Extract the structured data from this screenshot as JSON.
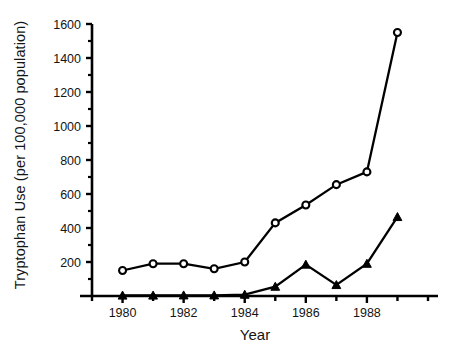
{
  "chart_data": {
    "type": "line",
    "title": "",
    "xlabel": "Year",
    "ylabel": "Tryptophan Use (per 100,000 population)",
    "x": [
      1980,
      1981,
      1982,
      1983,
      1984,
      1985,
      1986,
      1987,
      1988,
      1989
    ],
    "xlim": [
      1979,
      1990
    ],
    "ylim": [
      0,
      1600
    ],
    "y_major_ticks": [
      200,
      400,
      600,
      800,
      1000,
      1200,
      1400,
      1600
    ],
    "y_tick_labels": [
      "200",
      "400",
      "600",
      "800",
      "1000",
      "1200",
      "1400",
      "1600"
    ],
    "y_minor_ticks": [
      100,
      300,
      500,
      700,
      900,
      1100,
      1300,
      1500
    ],
    "x_major_ticks": [
      1980,
      1982,
      1984,
      1986,
      1988
    ],
    "x_tick_labels": [
      "1980",
      "1982",
      "1984",
      "1986",
      "1988"
    ],
    "x_all_ticks": [
      1979,
      1980,
      1981,
      1982,
      1983,
      1984,
      1985,
      1986,
      1987,
      1988,
      1989,
      1990
    ],
    "grid": false,
    "legend": "none",
    "series": [
      {
        "name": "open-circle-series",
        "marker": "open-circle",
        "color": "#000000",
        "values": [
          150,
          190,
          190,
          160,
          200,
          430,
          535,
          655,
          730,
          1550
        ]
      },
      {
        "name": "filled-triangle-series",
        "marker": "filled-triangle",
        "color": "#000000",
        "values": [
          3,
          3,
          4,
          4,
          8,
          55,
          185,
          65,
          190,
          465
        ]
      }
    ]
  },
  "axis": {
    "y_axis_name": "y-axis",
    "x_axis_name": "x-axis"
  }
}
